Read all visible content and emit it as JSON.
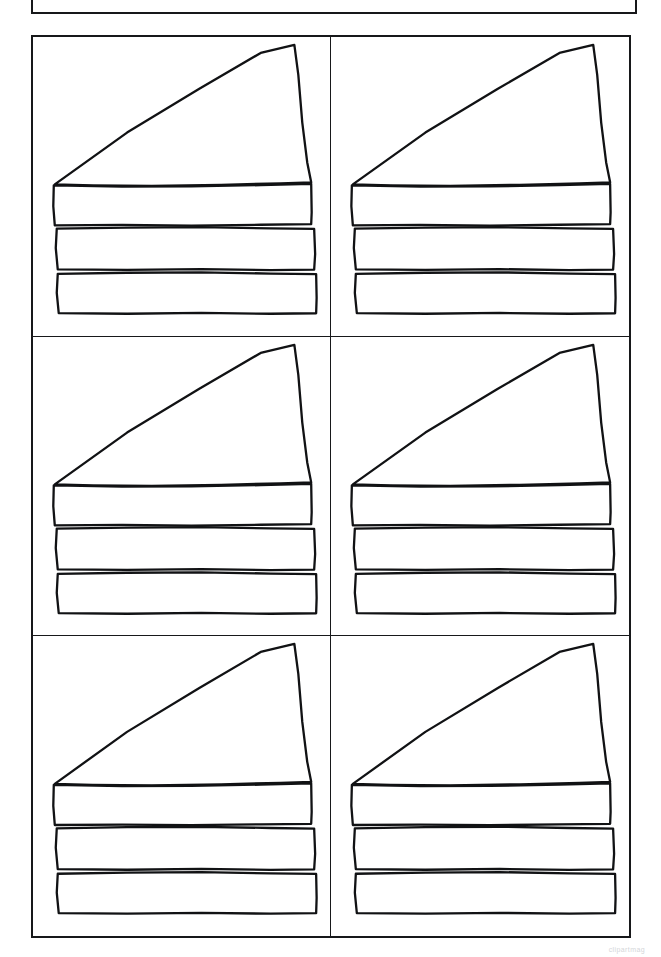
{
  "page": {
    "background_color": "#ffffff",
    "ink_color": "#111214",
    "width": 661,
    "height": 957
  },
  "header_box": {
    "name": "header-frame",
    "label": "",
    "border_color": "#17181a",
    "clipped_at_top": "true"
  },
  "grid": {
    "columns": 2,
    "rows": 3,
    "border_color": "#17181a",
    "cells": [
      {
        "id": "cell-1",
        "position": "row-1-col-1",
        "artwork_label": "cake-slice-outline"
      },
      {
        "id": "cell-2",
        "position": "row-1-col-2",
        "artwork_label": "cake-slice-outline"
      },
      {
        "id": "cell-3",
        "position": "row-2-col-1",
        "artwork_label": "cake-slice-outline"
      },
      {
        "id": "cell-4",
        "position": "row-2-col-2",
        "artwork_label": "cake-slice-outline"
      },
      {
        "id": "cell-5",
        "position": "row-3-col-1",
        "artwork_label": "cake-slice-outline"
      },
      {
        "id": "cell-6",
        "position": "row-3-col-2",
        "artwork_label": "cake-slice-outline"
      }
    ]
  },
  "artwork": {
    "name": "cake-slice-outline",
    "description": "Hand-drawn line-art outline of a three-layer cake slice with a tall triangular frosting top",
    "stroke_color": "#111214",
    "fill_color": "#ffffff",
    "parts": [
      {
        "name": "frosting-top-triangle"
      },
      {
        "name": "cake-layer-top"
      },
      {
        "name": "cake-layer-middle"
      },
      {
        "name": "cake-layer-bottom"
      }
    ]
  },
  "watermark": {
    "text": "clipartmag"
  }
}
